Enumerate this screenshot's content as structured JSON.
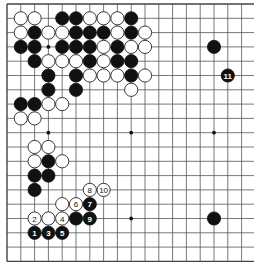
{
  "board": {
    "size": 19,
    "visible_columns": 18,
    "origin_x": 7,
    "origin_y": 4,
    "spacing_x": 13.8,
    "spacing_y": 14.3,
    "stone_radius": 6.6,
    "colors": {
      "black": "#111111",
      "white": "#ffffff",
      "line": "#555555",
      "background": "#ffffff"
    },
    "star_points": [
      [
        3,
        3
      ],
      [
        9,
        3
      ],
      [
        15,
        3
      ],
      [
        3,
        9
      ],
      [
        9,
        9
      ],
      [
        15,
        9
      ],
      [
        3,
        15
      ],
      [
        9,
        15
      ],
      [
        15,
        15
      ]
    ],
    "stones": [
      {
        "c": 1,
        "r": 1,
        "color": "white"
      },
      {
        "c": 2,
        "r": 1,
        "color": "white"
      },
      {
        "c": 4,
        "r": 1,
        "color": "black"
      },
      {
        "c": 5,
        "r": 1,
        "color": "black"
      },
      {
        "c": 6,
        "r": 1,
        "color": "white"
      },
      {
        "c": 7,
        "r": 1,
        "color": "white"
      },
      {
        "c": 8,
        "r": 1,
        "color": "white"
      },
      {
        "c": 9,
        "r": 1,
        "color": "black"
      },
      {
        "c": 1,
        "r": 2,
        "color": "white"
      },
      {
        "c": 2,
        "r": 2,
        "color": "black"
      },
      {
        "c": 3,
        "r": 2,
        "color": "white"
      },
      {
        "c": 4,
        "r": 2,
        "color": "white"
      },
      {
        "c": 5,
        "r": 2,
        "color": "black"
      },
      {
        "c": 6,
        "r": 2,
        "color": "black"
      },
      {
        "c": 7,
        "r": 2,
        "color": "black"
      },
      {
        "c": 8,
        "r": 2,
        "color": "white"
      },
      {
        "c": 9,
        "r": 2,
        "color": "black"
      },
      {
        "c": 10,
        "r": 2,
        "color": "white"
      },
      {
        "c": 1,
        "r": 3,
        "color": "black"
      },
      {
        "c": 2,
        "r": 3,
        "color": "black"
      },
      {
        "c": 4,
        "r": 3,
        "color": "black"
      },
      {
        "c": 5,
        "r": 3,
        "color": "black"
      },
      {
        "c": 6,
        "r": 3,
        "color": "black"
      },
      {
        "c": 7,
        "r": 3,
        "color": "white"
      },
      {
        "c": 8,
        "r": 3,
        "color": "black"
      },
      {
        "c": 9,
        "r": 3,
        "color": "white"
      },
      {
        "c": 10,
        "r": 3,
        "color": "white"
      },
      {
        "c": 15,
        "r": 3,
        "color": "black"
      },
      {
        "c": 2,
        "r": 4,
        "color": "black"
      },
      {
        "c": 3,
        "r": 4,
        "color": "white"
      },
      {
        "c": 4,
        "r": 4,
        "color": "white"
      },
      {
        "c": 5,
        "r": 4,
        "color": "white"
      },
      {
        "c": 6,
        "r": 4,
        "color": "black"
      },
      {
        "c": 7,
        "r": 4,
        "color": "white"
      },
      {
        "c": 8,
        "r": 4,
        "color": "black"
      },
      {
        "c": 9,
        "r": 4,
        "color": "black"
      },
      {
        "c": 3,
        "r": 5,
        "color": "black"
      },
      {
        "c": 5,
        "r": 5,
        "color": "black"
      },
      {
        "c": 6,
        "r": 5,
        "color": "white"
      },
      {
        "c": 7,
        "r": 5,
        "color": "white"
      },
      {
        "c": 8,
        "r": 5,
        "color": "white"
      },
      {
        "c": 9,
        "r": 5,
        "color": "black"
      },
      {
        "c": 10,
        "r": 5,
        "color": "white"
      },
      {
        "c": 16,
        "r": 5,
        "color": "black",
        "label": "11"
      },
      {
        "c": 3,
        "r": 6,
        "color": "black"
      },
      {
        "c": 5,
        "r": 6,
        "color": "black"
      },
      {
        "c": 9,
        "r": 6,
        "color": "white"
      },
      {
        "c": 1,
        "r": 7,
        "color": "black"
      },
      {
        "c": 2,
        "r": 7,
        "color": "black"
      },
      {
        "c": 3,
        "r": 7,
        "color": "white"
      },
      {
        "c": 4,
        "r": 7,
        "color": "white"
      },
      {
        "c": 1,
        "r": 8,
        "color": "white"
      },
      {
        "c": 2,
        "r": 8,
        "color": "white"
      },
      {
        "c": 2,
        "r": 10,
        "color": "white"
      },
      {
        "c": 3,
        "r": 10,
        "color": "white"
      },
      {
        "c": 2,
        "r": 11,
        "color": "white"
      },
      {
        "c": 3,
        "r": 11,
        "color": "black"
      },
      {
        "c": 4,
        "r": 11,
        "color": "white"
      },
      {
        "c": 2,
        "r": 12,
        "color": "black"
      },
      {
        "c": 3,
        "r": 12,
        "color": "black"
      },
      {
        "c": 2,
        "r": 13,
        "color": "black"
      },
      {
        "c": 6,
        "r": 13,
        "color": "white",
        "label": "8"
      },
      {
        "c": 7,
        "r": 13,
        "color": "white",
        "label": "10"
      },
      {
        "c": 4,
        "r": 14,
        "color": "white"
      },
      {
        "c": 5,
        "r": 14,
        "color": "white",
        "label": "6"
      },
      {
        "c": 6,
        "r": 14,
        "color": "black",
        "label": "7"
      },
      {
        "c": 2,
        "r": 15,
        "color": "white",
        "label": "2"
      },
      {
        "c": 3,
        "r": 15,
        "color": "white"
      },
      {
        "c": 4,
        "r": 15,
        "color": "white",
        "label": "4"
      },
      {
        "c": 5,
        "r": 15,
        "color": "black"
      },
      {
        "c": 6,
        "r": 15,
        "color": "black",
        "label": "9"
      },
      {
        "c": 15,
        "r": 15,
        "color": "black"
      },
      {
        "c": 2,
        "r": 16,
        "color": "black",
        "label": "1"
      },
      {
        "c": 3,
        "r": 16,
        "color": "black",
        "label": "3"
      },
      {
        "c": 4,
        "r": 16,
        "color": "black",
        "label": "5"
      }
    ]
  }
}
